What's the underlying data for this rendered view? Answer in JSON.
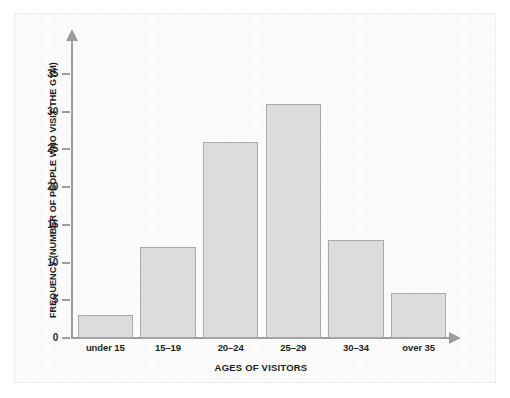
{
  "chart_data": {
    "type": "bar",
    "title": "",
    "subtitle": "",
    "categories": [
      "under 15",
      "15–19",
      "20–24",
      "25–29",
      "30–34",
      "over 35"
    ],
    "values": [
      3,
      12,
      26,
      31,
      13,
      6
    ],
    "xlabel": "AGES OF VISITORS",
    "ylabel": "FREQUENCY (NUMBER OF PEOPLE WHO VISIT THE GYM)",
    "ylim": [
      0,
      37
    ],
    "yticks": [
      0,
      5,
      10,
      15,
      20,
      25,
      30,
      35
    ],
    "ytick_labels": [
      "0",
      "5",
      "10",
      "15",
      "20",
      "25",
      "30",
      "35"
    ],
    "grid": false,
    "legend": null,
    "legend_position": "none",
    "bar_fill_color": "#dcdcdc",
    "bar_border_color": "#a9a9a9",
    "axis_color": "#9d9d9d",
    "background_color": "#fbfbfb",
    "text_color": "#1f1f1f"
  }
}
